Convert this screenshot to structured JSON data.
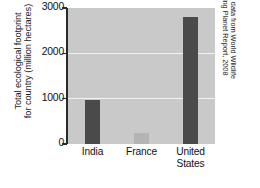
{
  "chart_data": {
    "type": "bar",
    "title": "",
    "xlabel": "",
    "ylabel_line1": "Total ecological footprint",
    "ylabel_line2": "for country (million hectares)",
    "categories": [
      "India",
      "France",
      "United States"
    ],
    "category_lines": [
      [
        "India"
      ],
      [
        "France"
      ],
      [
        "United",
        "States"
      ]
    ],
    "values": [
      970,
      250,
      2800
    ],
    "ylim": [
      0,
      3000
    ],
    "yticks": [
      0,
      1000,
      2000,
      3000
    ],
    "ytick_labels": [
      "0",
      "1000",
      "2000",
      "3000"
    ],
    "gridlines": [
      1000,
      2000
    ],
    "grid": true,
    "legend": "none",
    "bar_colors": [
      "#4a4a4a",
      "#b4b4b4",
      "#4a4a4a"
    ],
    "plot_background": "#c9c9c9",
    "gridline_color": "#f2f2f2",
    "axis_color": "#2a2a2a"
  },
  "annotations": {
    "source_line1": "Based on data from World Wildlife",
    "source_line2": "Fund, Living Planet Report, 2008"
  }
}
